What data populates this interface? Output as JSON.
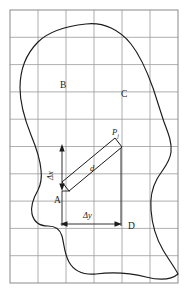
{
  "figure": {
    "type": "geometry-diagram",
    "width": 194,
    "height": 298,
    "background_color": "#ffffff"
  },
  "grid": {
    "line_color": "#9a9a9a",
    "border_color": "#8a8a8a",
    "origin_x": 10,
    "origin_y": 10,
    "cell_width": 28,
    "cell_height": 27.3,
    "columns": 6,
    "rows": 10,
    "right_x": 178,
    "bottom_y": 283
  },
  "outline": {
    "stroke_color": "#1b1b1b",
    "stroke_width": 1.15,
    "description": "closed irregular blob outline"
  },
  "strip": {
    "stroke_color": "#1b1b1b",
    "stroke_width": 1.0,
    "description": "inclined narrow rectangle from point A region to point Pj"
  },
  "region_labels": [
    {
      "id": "label-b",
      "text": "B",
      "x": 60,
      "y": 81
    },
    {
      "id": "label-c",
      "text": "C",
      "x": 121,
      "y": 90
    },
    {
      "id": "label-a",
      "text": "A",
      "x": 54,
      "y": 196
    },
    {
      "id": "label-d",
      "text": "D",
      "x": 128,
      "y": 222
    }
  ],
  "annotations": {
    "point_label": {
      "base": "P",
      "subscript": "j",
      "x": 112,
      "y": 128
    },
    "distance_label": {
      "text": "d",
      "x": 90,
      "y": 164
    },
    "delta_x_label": {
      "text": "Δx",
      "x": 46,
      "y": 176
    },
    "delta_y_label": {
      "text": "Δy",
      "x": 83,
      "y": 211
    }
  },
  "dimensions": {
    "delta_x": {
      "orientation": "vertical",
      "x": 62,
      "y_top": 146,
      "y_bottom": 189,
      "label": "Δx"
    },
    "delta_y": {
      "orientation": "horizontal",
      "y": 224,
      "x_left": 62,
      "x_right": 120,
      "label": "Δy"
    }
  },
  "colors": {
    "ink": "#1b1b1b",
    "grid": "#9a9a9a",
    "paper": "#ffffff"
  }
}
